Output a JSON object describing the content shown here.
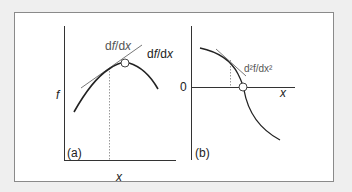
{
  "figure": {
    "panel_a": {
      "label": "(a)",
      "y_axis_label": "f",
      "x_axis_label": "x",
      "tangent_label_d": "d",
      "tangent_label_f": "f",
      "tangent_label_slash": "/",
      "tangent_label_dx": "d",
      "tangent_label_x": "x",
      "tangent_label": "df/dx"
    },
    "panel_b": {
      "label": "(b)",
      "y_axis_label": "df/dx",
      "y_axis_label_d": "d",
      "y_axis_label_f": "f",
      "y_axis_label_rest": "/d",
      "y_axis_label_x": "x",
      "zero_label": "0",
      "x_axis_label": "x",
      "tangent_label": "d²f/dx²"
    }
  },
  "colors": {
    "background": "#efefef",
    "panel": "#ffffff",
    "border": "#8a8a8a",
    "curve": "#222222",
    "tangent": "#777777",
    "axis": "#333333",
    "dotted": "#999999"
  }
}
